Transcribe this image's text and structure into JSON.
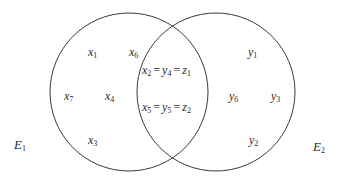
{
  "diagram": {
    "type": "venn",
    "stroke_color": "#3a3a3a",
    "background": "#ffffff",
    "sets": [
      {
        "name": "E",
        "sub": "1",
        "cx": 129,
        "cy": 92,
        "r": 79,
        "label_pos": [
          14,
          138
        ]
      },
      {
        "name": "E",
        "sub": "2",
        "cx": 216,
        "cy": 92,
        "r": 79,
        "label_pos": [
          313,
          140
        ]
      }
    ],
    "left_only": [
      {
        "var": "x",
        "sub": "1",
        "pos": [
          88,
          46
        ]
      },
      {
        "var": "x",
        "sub": "6",
        "pos": [
          129,
          46
        ]
      },
      {
        "var": "x",
        "sub": "7",
        "pos": [
          64,
          90
        ]
      },
      {
        "var": "x",
        "sub": "4",
        "pos": [
          105,
          90
        ]
      },
      {
        "var": "x",
        "sub": "3",
        "pos": [
          88,
          134
        ]
      }
    ],
    "intersection": [
      {
        "terms": [
          {
            "var": "x",
            "sub": "2"
          },
          {
            "var": "y",
            "sub": "4"
          },
          {
            "var": "z",
            "sub": "1"
          }
        ],
        "equals": "=",
        "pos": [
          142,
          64
        ]
      },
      {
        "terms": [
          {
            "var": "x",
            "sub": "5"
          },
          {
            "var": "y",
            "sub": "5"
          },
          {
            "var": "z",
            "sub": "2"
          }
        ],
        "equals": "=",
        "pos": [
          142,
          101
        ]
      }
    ],
    "right_only": [
      {
        "var": "y",
        "sub": "1",
        "pos": [
          248,
          46
        ]
      },
      {
        "var": "y",
        "sub": "6",
        "pos": [
          229,
          90
        ]
      },
      {
        "var": "y",
        "sub": "3",
        "pos": [
          271,
          90
        ]
      },
      {
        "var": "y",
        "sub": "2",
        "pos": [
          249,
          134
        ]
      }
    ]
  }
}
